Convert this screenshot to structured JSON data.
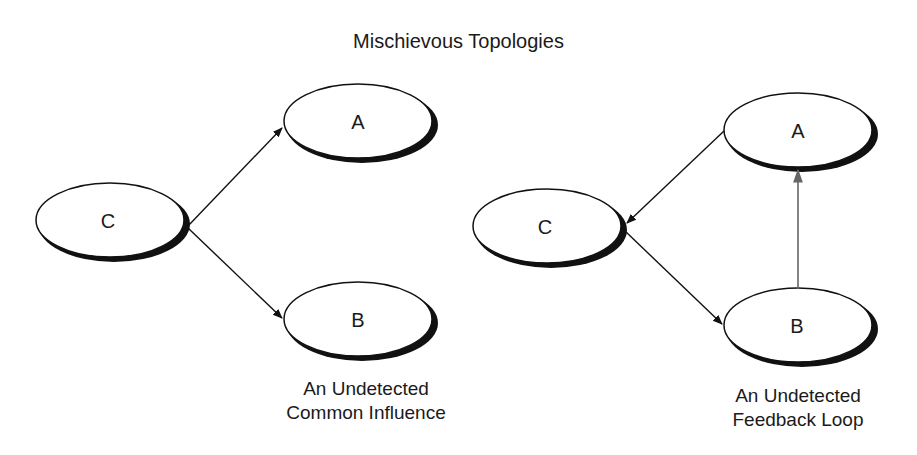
{
  "title": "Mischievous Topologies",
  "diagrams": [
    {
      "name": "common-influence",
      "nodes": [
        {
          "id": "C",
          "label": "C"
        },
        {
          "id": "A",
          "label": "A"
        },
        {
          "id": "B",
          "label": "B"
        }
      ],
      "edges": [
        {
          "from": "C",
          "to": "A"
        },
        {
          "from": "C",
          "to": "B"
        }
      ],
      "caption": [
        "An Undetected",
        "Common Influence"
      ]
    },
    {
      "name": "feedback-loop",
      "nodes": [
        {
          "id": "A",
          "label": "A"
        },
        {
          "id": "C",
          "label": "C"
        },
        {
          "id": "B",
          "label": "B"
        }
      ],
      "edges": [
        {
          "from": "A",
          "to": "C"
        },
        {
          "from": "C",
          "to": "B"
        },
        {
          "from": "B",
          "to": "A",
          "color": "#666666"
        }
      ],
      "caption": [
        "An Undetected",
        "Feedback Loop"
      ]
    }
  ],
  "colors": {
    "stroke": "#111111",
    "feedback_edge": "#666666",
    "background": "#ffffff"
  }
}
